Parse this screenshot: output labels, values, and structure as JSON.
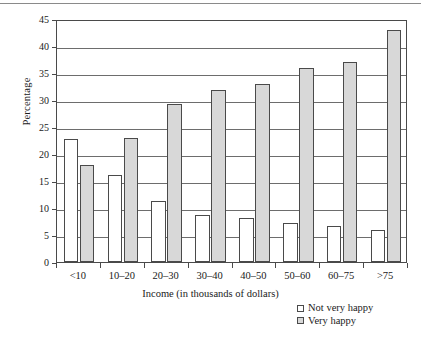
{
  "chart_data": {
    "type": "bar",
    "title": "",
    "subtitle": "",
    "xlabel": "Income (in thousands of dollars)",
    "ylabel": "Percentage",
    "categories": [
      "<10",
      "10–20",
      "20–30",
      "30–40",
      "40–50",
      "50–60",
      "60–75",
      ">75"
    ],
    "series": [
      {
        "name": "Not very happy",
        "color": "#ffffff",
        "values": [
          22.8,
          16.2,
          11.3,
          8.7,
          8.1,
          7.2,
          6.6,
          5.9
        ]
      },
      {
        "name": "Very happy",
        "color": "#d8d8d8",
        "values": [
          18.0,
          23.0,
          29.2,
          31.8,
          33.0,
          36.0,
          37.0,
          43.0
        ]
      }
    ],
    "ylim": [
      0,
      45
    ],
    "ytick_values": [
      0,
      5,
      10,
      15,
      20,
      25,
      30,
      35,
      40,
      45
    ],
    "ytick_labels": [
      "0",
      "5",
      "10",
      "15",
      "20",
      "25",
      "30",
      "35",
      "40",
      "45"
    ],
    "grid": true,
    "grid_axis": "y",
    "legend_position": "below-right",
    "legend_entries": [
      {
        "label": "Not very happy",
        "swatch": "white-square"
      },
      {
        "label": "Very happy",
        "swatch": "gray-square"
      }
    ]
  },
  "figure": {
    "plot_border_color": "#4a4a4a",
    "gridline_color": "#6d6d6d",
    "background": "#ffffff"
  }
}
